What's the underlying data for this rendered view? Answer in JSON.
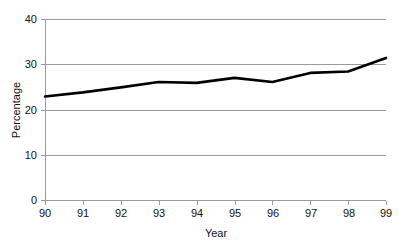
{
  "chart_data": {
    "type": "line",
    "title": "",
    "xlabel": "Year",
    "ylabel": "Percentage",
    "x": [
      "90",
      "91",
      "92",
      "93",
      "94",
      "95",
      "96",
      "97",
      "98",
      "99"
    ],
    "categories": [
      "90",
      "91",
      "92",
      "93",
      "94",
      "95",
      "96",
      "97",
      "98",
      "99"
    ],
    "values": [
      23.0,
      23.9,
      25.0,
      26.2,
      26.0,
      27.1,
      26.2,
      28.2,
      28.5,
      31.5
    ],
    "series": [
      {
        "name": "Percentage",
        "values": [
          23.0,
          23.9,
          25.0,
          26.2,
          26.0,
          27.1,
          26.2,
          28.2,
          28.5,
          31.5
        ],
        "color": "#000000"
      }
    ],
    "ylim": [
      0,
      40
    ],
    "yticks": [
      0,
      10,
      20,
      30,
      40
    ],
    "ytick_labels": [
      "0",
      "10",
      "20",
      "30",
      "40"
    ],
    "xtick_labels": [
      "90",
      "91",
      "92",
      "93",
      "94",
      "95",
      "96",
      "97",
      "98",
      "99"
    ],
    "grid": true,
    "grid_axis": "y",
    "legend": false,
    "legend_position": "none",
    "annotations": []
  },
  "colors": {
    "line": "#000000",
    "grid": "#9a9a9a",
    "axis": "#9a9a9a",
    "text": "#111111",
    "background": "#ffffff"
  }
}
